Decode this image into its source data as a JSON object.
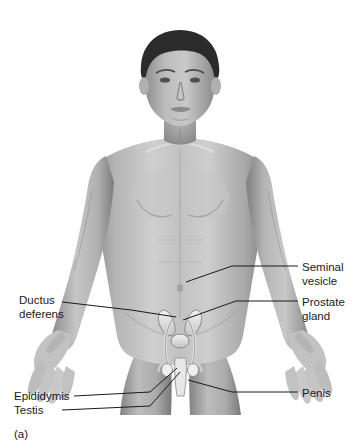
{
  "figure": {
    "title_caption": "(a)",
    "background_color": "#ffffff",
    "ink_color": "#1a1a1a",
    "skin_tone_light": "#cfcfcf",
    "skin_tone_mid": "#a9a9a9",
    "skin_tone_dark": "#7d7d7d",
    "hair_color": "#2b2b2b",
    "organ_highlight": "#ededed"
  },
  "labels": [
    {
      "id": "ductus-deferens",
      "text": "Ductus\ndeferens",
      "x": 19,
      "y": 294,
      "align": "left"
    },
    {
      "id": "epididymis",
      "text": "Epididymis",
      "x": 14,
      "y": 390,
      "align": "left"
    },
    {
      "id": "testis",
      "text": "Testis",
      "x": 14,
      "y": 404,
      "align": "left"
    },
    {
      "id": "seminal-vesicle",
      "text": "Seminal\nvesicle",
      "x": 302,
      "y": 261,
      "align": "left"
    },
    {
      "id": "prostate-gland",
      "text": "Prostate\ngland",
      "x": 302,
      "y": 296,
      "align": "left"
    },
    {
      "id": "penis",
      "text": "Penis",
      "x": 302,
      "y": 387,
      "align": "left"
    }
  ],
  "leader_lines": [
    {
      "id": "ductus-deferens-leader",
      "points": "62,302 131,310 176,317"
    },
    {
      "id": "epididymis-leader",
      "points": "74,396 150,392 177,368"
    },
    {
      "id": "testis-leader",
      "points": "62,410 150,406 180,372"
    },
    {
      "id": "seminal-vesicle-leader",
      "points": "298,266 232,266 186,282"
    },
    {
      "id": "prostate-gland-leader",
      "points": "298,301 236,301 183,320"
    },
    {
      "id": "penis-leader",
      "points": "298,392 232,392 188,380"
    }
  ],
  "anatomy_parts": [
    {
      "id": "head",
      "name": "head"
    },
    {
      "id": "hair",
      "name": "hair"
    },
    {
      "id": "face",
      "name": "face"
    },
    {
      "id": "neck",
      "name": "neck"
    },
    {
      "id": "torso",
      "name": "torso"
    },
    {
      "id": "left-arm",
      "name": "left-arm"
    },
    {
      "id": "right-arm",
      "name": "right-arm"
    },
    {
      "id": "left-hand",
      "name": "left-hand"
    },
    {
      "id": "right-hand",
      "name": "right-hand"
    },
    {
      "id": "left-thigh",
      "name": "left-thigh"
    },
    {
      "id": "right-thigh",
      "name": "right-thigh"
    },
    {
      "id": "seminal-vesicles",
      "name": "seminal-vesicles"
    },
    {
      "id": "prostate",
      "name": "prostate"
    },
    {
      "id": "ductus-deferens-tubes",
      "name": "ductus-deferens-tubes"
    },
    {
      "id": "testes",
      "name": "testes"
    },
    {
      "id": "epididymides",
      "name": "epididymides"
    },
    {
      "id": "penis-shaft",
      "name": "penis-shaft"
    }
  ]
}
